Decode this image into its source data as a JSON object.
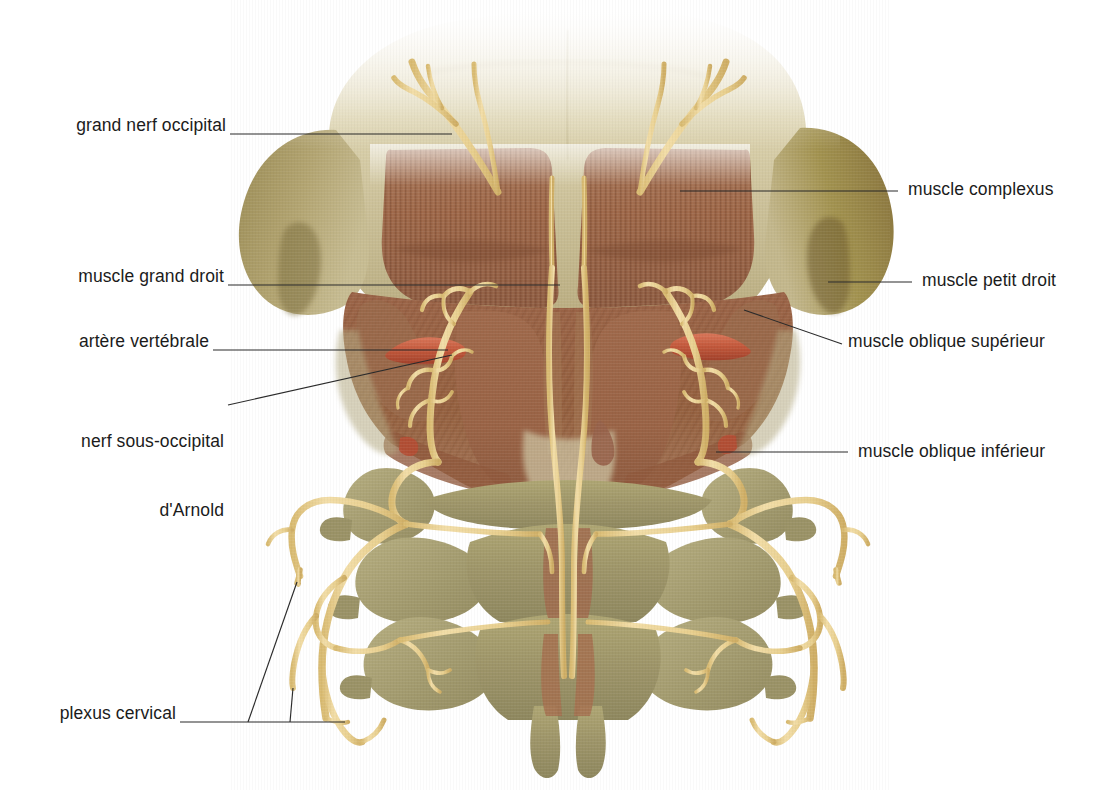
{
  "figure": {
    "kind": "anatomical-illustration",
    "background_color": "#ffffff",
    "palette": {
      "skull_bone": "#cdc29c",
      "skull_bone_dark": "#8a7540",
      "mastoid": "#9a8b57",
      "muscle": "#9d6647",
      "muscle_light": "#b08264",
      "muscle_deep": "#8a5338",
      "vertebra": "#9d9468",
      "vertebra_light": "#b4ad86",
      "nerve": "#eed79a",
      "nerve_shadow": "#d6b46a",
      "artery": "#c4593c",
      "leader_line": "#2b2b2b",
      "label_text": "#1b1b1b"
    }
  },
  "labels": {
    "left": [
      {
        "id": "grand-nerf-occipital",
        "text": "grand nerf occipital",
        "x": 44,
        "y": 114,
        "leader": [
          [
            230,
            134
          ],
          [
            452,
            134
          ]
        ]
      },
      {
        "id": "muscle-grand-droit",
        "text": "muscle grand droit",
        "x": 47,
        "y": 265,
        "leader": [
          [
            228,
            285
          ],
          [
            560,
            285
          ]
        ]
      },
      {
        "id": "artere-vertebrale",
        "text": "artère vertébrale",
        "x": 47,
        "y": 330,
        "leader": [
          [
            213,
            350
          ],
          [
            448,
            350
          ]
        ]
      },
      {
        "id": "nerf-sous-occipital-arnold",
        "text": "nerf sous-occipital\nd'Arnold",
        "line1": "nerf sous-occipital",
        "line2": "d'Arnold",
        "x": 47,
        "y": 384,
        "leader": [
          [
            228,
            405
          ],
          [
            452,
            355
          ]
        ]
      },
      {
        "id": "plexus-cervical",
        "text": "plexus cervical",
        "x": 47,
        "y": 702,
        "leader_main": [
          [
            180,
            722
          ],
          [
            345,
            722
          ]
        ],
        "leader_branch_a": [
          [
            248,
            722
          ],
          [
            297,
            582
          ]
        ],
        "leader_branch_b": [
          [
            290,
            722
          ],
          [
            293,
            688
          ]
        ]
      }
    ],
    "right": [
      {
        "id": "muscle-complexus",
        "text": "muscle complexus",
        "x": 908,
        "y": 178,
        "leader": [
          [
            680,
            191
          ],
          [
            898,
            191
          ]
        ]
      },
      {
        "id": "muscle-petit-droit",
        "text": "muscle petit droit",
        "x": 922,
        "y": 269,
        "leader": [
          [
            828,
            282
          ],
          [
            912,
            282
          ]
        ]
      },
      {
        "id": "muscle-oblique-superieur",
        "text": "muscle oblique supérieur",
        "x": 848,
        "y": 330,
        "leader": [
          [
            744,
            310
          ],
          [
            842,
            344
          ]
        ]
      },
      {
        "id": "muscle-oblique-inferieur",
        "text": "muscle oblique inférieur",
        "x": 858,
        "y": 440,
        "leader": [
          [
            716,
            452
          ],
          [
            848,
            452
          ]
        ]
      }
    ]
  },
  "structures": [
    {
      "id": "occipital-bone",
      "name": "os occipital"
    },
    {
      "id": "mastoid-left",
      "name": "apophyse mastoïde gauche"
    },
    {
      "id": "mastoid-right",
      "name": "apophyse mastoïde droite"
    },
    {
      "id": "complexus-left",
      "name": "muscle complexus gauche"
    },
    {
      "id": "complexus-right",
      "name": "muscle complexus droit"
    },
    {
      "id": "grand-droit",
      "name": "muscle grand droit postérieur"
    },
    {
      "id": "petit-droit",
      "name": "muscle petit droit postérieur"
    },
    {
      "id": "oblique-superieur",
      "name": "muscle oblique supérieur"
    },
    {
      "id": "oblique-inferieur",
      "name": "muscle oblique inférieur"
    },
    {
      "id": "vertebra-c1",
      "name": "atlas (C1)"
    },
    {
      "id": "vertebra-c2",
      "name": "axis (C2)"
    },
    {
      "id": "vertebra-c3",
      "name": "vertèbre C3"
    },
    {
      "id": "artery-left",
      "name": "artère vertébrale gauche"
    },
    {
      "id": "artery-right",
      "name": "artère vertébrale droite"
    },
    {
      "id": "nerve-occipital-left",
      "name": "grand nerf occipital gauche"
    },
    {
      "id": "nerve-occipital-right",
      "name": "grand nerf occipital droit"
    },
    {
      "id": "plexus-left",
      "name": "plexus cervical gauche"
    },
    {
      "id": "plexus-right",
      "name": "plexus cervical droit"
    }
  ]
}
